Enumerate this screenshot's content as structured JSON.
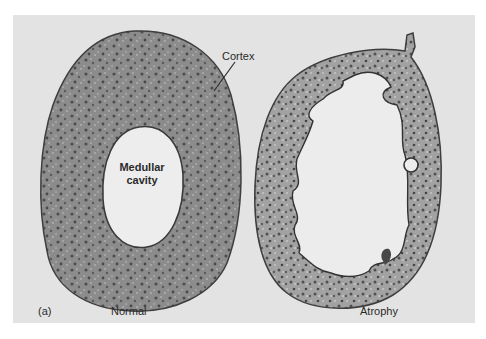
{
  "figure": {
    "panel_letter": "(a)",
    "specimens": [
      {
        "id": "normal",
        "caption": "Normal",
        "annotations": {
          "cortex_label": "Cortex",
          "cavity_label_line1": "Medullar",
          "cavity_label_line2": "cavity"
        }
      },
      {
        "id": "atrophy",
        "caption": "Atrophy"
      }
    ],
    "colors": {
      "page_background": "#ffffff",
      "panel_background": "#e3e3e3",
      "tissue_fill": "#8a8a8a",
      "tissue_dark": "#4a4a4a",
      "cavity_fill": "#ececec",
      "text": "#2a2a2a"
    }
  }
}
